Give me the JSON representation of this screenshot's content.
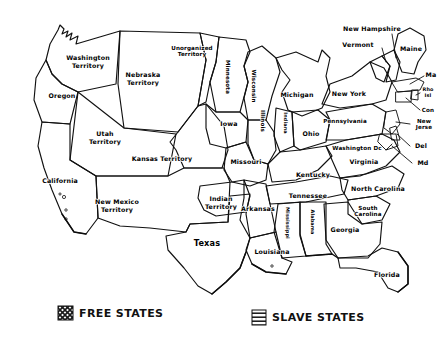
{
  "map": {
    "title": "Free States and Slave States of the United States (c. 1854)",
    "style": "hand-drawn pen and ink sketch, black on white",
    "patterns": {
      "free": "cross-hatch / checkered fill",
      "slave": "horizontal line hatching",
      "territory": "no fill (plain white)"
    },
    "colors": {
      "ink": "#111111",
      "paper": "#ffffff"
    },
    "regions": [
      {
        "id": "washington-territory",
        "label": "Washington\nTerritory",
        "fill": "territory",
        "label_x": 88,
        "label_y": 62,
        "rotate": 0,
        "size": "sm"
      },
      {
        "id": "oregon",
        "label": "Oregon",
        "fill": "free",
        "label_x": 62,
        "label_y": 96,
        "rotate": 0,
        "size": "sm"
      },
      {
        "id": "california",
        "label": "California",
        "fill": "free",
        "label_x": 60,
        "label_y": 181,
        "rotate": 0,
        "size": "sm"
      },
      {
        "id": "utah-territory",
        "label": "Utah\nTerritory",
        "fill": "territory",
        "label_x": 105,
        "label_y": 138,
        "rotate": 0,
        "size": "sm"
      },
      {
        "id": "new-mexico-territory",
        "label": "New Mexico\nTerritory",
        "fill": "territory",
        "label_x": 117,
        "label_y": 206,
        "rotate": 0,
        "size": "sm"
      },
      {
        "id": "nebraska-territory",
        "label": "Nebraska\nTerritory",
        "fill": "territory",
        "label_x": 143,
        "label_y": 79,
        "rotate": 0,
        "size": "sm"
      },
      {
        "id": "unorganized-territory",
        "label": "Unorganized\nTerritory",
        "fill": "territory",
        "label_x": 192,
        "label_y": 51,
        "rotate": 0,
        "size": "xs"
      },
      {
        "id": "kansas-territory",
        "label": "Kansas Territory",
        "fill": "territory",
        "label_x": 162,
        "label_y": 159,
        "rotate": 0,
        "size": "sm"
      },
      {
        "id": "indian-territory",
        "label": "Indian\nTerritory",
        "fill": "territory",
        "label_x": 221,
        "label_y": 203,
        "rotate": 0,
        "size": "sm"
      },
      {
        "id": "minnesota",
        "label": "Minnesota",
        "fill": "free",
        "label_x": 228,
        "label_y": 77,
        "rotate": 90,
        "size": "xs"
      },
      {
        "id": "wisconsin",
        "label": "Wisconsin",
        "fill": "free",
        "label_x": 254,
        "label_y": 86,
        "rotate": 90,
        "size": "xs"
      },
      {
        "id": "iowa",
        "label": "Iowa",
        "fill": "free",
        "label_x": 229,
        "label_y": 124,
        "rotate": 0,
        "size": "sm"
      },
      {
        "id": "illinois",
        "label": "Illinois",
        "fill": "free",
        "label_x": 263,
        "label_y": 121,
        "rotate": 90,
        "size": "xs"
      },
      {
        "id": "missouri",
        "label": "Missouri",
        "fill": "slave",
        "label_x": 246,
        "label_y": 162,
        "rotate": 0,
        "size": "sm"
      },
      {
        "id": "michigan",
        "label": "Michigan",
        "fill": "free",
        "label_x": 297,
        "label_y": 95,
        "rotate": 0,
        "size": "sm"
      },
      {
        "id": "indiana",
        "label": "Indiana",
        "fill": "free",
        "label_x": 285,
        "label_y": 123,
        "rotate": 90,
        "size": "tiny"
      },
      {
        "id": "ohio",
        "label": "Ohio",
        "fill": "free",
        "label_x": 311,
        "label_y": 134,
        "rotate": 0,
        "size": "sm"
      },
      {
        "id": "pennsylvania",
        "label": "Pennsylvania",
        "fill": "free",
        "label_x": 345,
        "label_y": 121,
        "rotate": 0,
        "size": "xs"
      },
      {
        "id": "new-york",
        "label": "New York",
        "fill": "free",
        "label_x": 349,
        "label_y": 94,
        "rotate": 0,
        "size": "sm"
      },
      {
        "id": "maine",
        "label": "Maine",
        "fill": "free",
        "label_x": 411,
        "label_y": 49,
        "rotate": 0,
        "size": "sm"
      },
      {
        "id": "new-hampshire",
        "label": "New Hampshire",
        "fill": "free",
        "label_x": 372,
        "label_y": 29,
        "rotate": 0,
        "size": "sm"
      },
      {
        "id": "vermont",
        "label": "Vermont",
        "fill": "free",
        "label_x": 358,
        "label_y": 45,
        "rotate": 0,
        "size": "sm"
      },
      {
        "id": "massachusetts",
        "label": "Ma",
        "fill": "free",
        "label_x": 431,
        "label_y": 75,
        "rotate": 0,
        "size": "sm"
      },
      {
        "id": "rhode-island",
        "label": "Rho\nIsl",
        "fill": "free",
        "label_x": 428,
        "label_y": 93,
        "rotate": 0,
        "size": "tiny"
      },
      {
        "id": "connecticut",
        "label": "Con",
        "fill": "free",
        "label_x": 428,
        "label_y": 110,
        "rotate": 0,
        "size": "xs"
      },
      {
        "id": "new-jersey",
        "label": "New\nJerse",
        "fill": "free",
        "label_x": 424,
        "label_y": 124,
        "rotate": 0,
        "size": "xs"
      },
      {
        "id": "delaware",
        "label": "Del",
        "fill": "slave",
        "label_x": 421,
        "label_y": 146,
        "rotate": 0,
        "size": "sm"
      },
      {
        "id": "maryland",
        "label": "Md",
        "fill": "slave",
        "label_x": 423,
        "label_y": 163,
        "rotate": 0,
        "size": "sm"
      },
      {
        "id": "washington-dc",
        "label": "Washington Dc",
        "fill": "slave",
        "label_x": 357,
        "label_y": 148,
        "rotate": 0,
        "size": "xs"
      },
      {
        "id": "virginia",
        "label": "Virginia",
        "fill": "slave",
        "label_x": 364,
        "label_y": 162,
        "rotate": 0,
        "size": "sm"
      },
      {
        "id": "kentucky",
        "label": "Kentucky",
        "fill": "slave",
        "label_x": 313,
        "label_y": 175,
        "rotate": 0,
        "size": "sm"
      },
      {
        "id": "tennessee",
        "label": "Tennessee",
        "fill": "slave",
        "label_x": 308,
        "label_y": 196,
        "rotate": 0,
        "size": "sm"
      },
      {
        "id": "north-carolina",
        "label": "North Carolina",
        "fill": "slave",
        "label_x": 378,
        "label_y": 189,
        "rotate": 0,
        "size": "sm"
      },
      {
        "id": "south-carolina",
        "label": "South\nCarolina",
        "fill": "slave",
        "label_x": 368,
        "label_y": 211,
        "rotate": 0,
        "size": "xs"
      },
      {
        "id": "arkansas",
        "label": "Arkansas",
        "fill": "slave",
        "label_x": 258,
        "label_y": 209,
        "rotate": 0,
        "size": "sm"
      },
      {
        "id": "mississippi",
        "label": "Mississippi",
        "fill": "slave",
        "label_x": 287,
        "label_y": 223,
        "rotate": 90,
        "size": "tiny"
      },
      {
        "id": "alabama",
        "label": "Alabama",
        "fill": "slave",
        "label_x": 312,
        "label_y": 222,
        "rotate": 90,
        "size": "tiny"
      },
      {
        "id": "georgia",
        "label": "Georgia",
        "fill": "slave",
        "label_x": 345,
        "label_y": 230,
        "rotate": 0,
        "size": "sm"
      },
      {
        "id": "louisiana",
        "label": "Louisiana",
        "fill": "slave",
        "label_x": 272,
        "label_y": 252,
        "rotate": 0,
        "size": "sm"
      },
      {
        "id": "texas",
        "label": "Texas",
        "fill": "slave",
        "label_x": 207,
        "label_y": 243,
        "rotate": 0,
        "size": "big"
      },
      {
        "id": "florida",
        "label": "Florida",
        "fill": "slave",
        "label_x": 387,
        "label_y": 275,
        "rotate": 0,
        "size": "sm"
      }
    ],
    "legend": {
      "free": {
        "label": "FREE STATES",
        "swatch": "cross-hatch",
        "x": 60,
        "y": 314
      },
      "slave": {
        "label": "SLAVE STATES",
        "swatch": "horizontal-lines",
        "x": 254,
        "y": 318
      }
    }
  }
}
